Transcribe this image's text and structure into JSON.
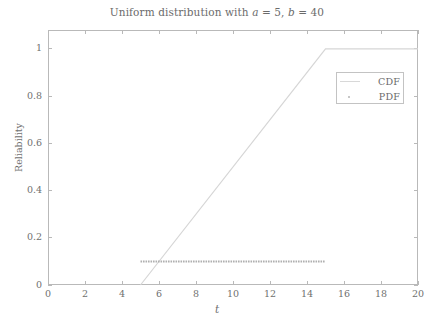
{
  "chart_data": {
    "type": "line",
    "title": "Uniform distribution with a = 5, b = 40",
    "title_parts": {
      "prefix": "Uniform distribution with ",
      "var_a": "a",
      "eq_a": " = 5, ",
      "var_b": "b",
      "eq_b": " = 40"
    },
    "xlabel": "t",
    "ylabel": "Reliability",
    "xlim": [
      0,
      20
    ],
    "ylim": [
      0,
      1.08
    ],
    "xticks": [
      0,
      2,
      4,
      6,
      8,
      10,
      12,
      14,
      16,
      18,
      20
    ],
    "xtick_labels": [
      "0",
      "2",
      "4",
      "6",
      "8",
      "10",
      "12",
      "14",
      "16",
      "18",
      "20"
    ],
    "yticks": [
      0,
      0.2,
      0.4,
      0.6,
      0.8,
      1
    ],
    "ytick_labels": [
      "0",
      "0.2",
      "0.4",
      "0.6",
      "0.8",
      "1"
    ],
    "grid": false,
    "legend_position": "upper right",
    "parameters": {
      "a": 5,
      "b": 40
    },
    "series": [
      {
        "name": "CDF",
        "style": "solid-line",
        "color": "#d6d6d6",
        "x": [
          5,
          15,
          20
        ],
        "y": [
          0,
          1,
          1
        ]
      },
      {
        "name": "PDF",
        "style": "dotted-line",
        "color": "#b0b0b0",
        "x": [
          5,
          15
        ],
        "y": [
          0.1,
          0.1
        ]
      }
    ],
    "legend": [
      {
        "label": "CDF",
        "marker": "line"
      },
      {
        "label": "PDF",
        "marker": "dot"
      }
    ]
  },
  "colors": {
    "axis": "#b9b9b9",
    "text": "#6f6f6f",
    "cdf": "#d6d6d6",
    "pdf": "#b0b0b0",
    "legend_border": "#c3c3c3",
    "background": "#ffffff"
  }
}
